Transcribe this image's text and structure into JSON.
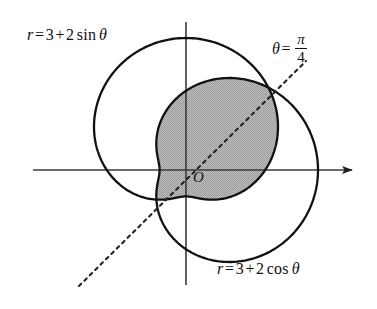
{
  "figure": {
    "background_color": "#ffffff",
    "curve_color": "#111111",
    "axis_color": "#3a3a3a",
    "shade_color": "#b0b0b0",
    "dash_color": "#222222"
  },
  "labels": {
    "sin_curve": {
      "r": "r",
      "equals": "=",
      "three": "3",
      "plus": "+",
      "two": "2",
      "func": "sin",
      "theta": "θ"
    },
    "cos_curve": {
      "r": "r",
      "equals": "=",
      "three": "3",
      "plus": "+",
      "two": "2",
      "func": "cos",
      "theta": "θ"
    },
    "ray": {
      "theta": "θ",
      "equals": "=",
      "numerator": "π",
      "denominator": "4"
    },
    "origin": "O"
  },
  "chart_data": {
    "type": "line",
    "coordinate_system": "polar",
    "origin_px": [
      186,
      170
    ],
    "scale_px_per_unit": 26.4,
    "xlabel": "",
    "ylabel": "",
    "grid": false,
    "legend": "inline-annotations",
    "series": [
      {
        "name": "r = 3 + 2 sin θ",
        "equation": "r = 3 + 2*sin(theta)",
        "a": 3,
        "b": 2,
        "trig": "sin",
        "r_max": 5,
        "r_min": 1,
        "style": "solid"
      },
      {
        "name": "r = 3 + 2 cos θ",
        "equation": "r = 3 + 2*cos(theta)",
        "a": 3,
        "b": 2,
        "trig": "cos",
        "r_max": 5,
        "r_min": 1,
        "style": "solid"
      },
      {
        "name": "θ = π/4",
        "equation": "theta = pi/4",
        "theta_value": 0.7853981634,
        "style": "dashed"
      }
    ],
    "intersections": [
      {
        "theta": 0.7853981634,
        "r": 4.414,
        "px": [
          272,
          95
        ],
        "label": "upper intersection"
      },
      {
        "theta": 3.926990817,
        "r": 1.586,
        "px": [
          145,
          196
        ],
        "label": "lower intersection"
      }
    ],
    "shaded_region": "intersection of the interiors of both cardioids",
    "axes": {
      "x_axis": {
        "from_px": [
          33,
          170
        ],
        "to_px": [
          360,
          170
        ],
        "arrow": "right"
      },
      "y_axis": {
        "from_px": [
          186,
          22
        ],
        "to_px": [
          186,
          285
        ],
        "arrow": "none"
      }
    }
  }
}
